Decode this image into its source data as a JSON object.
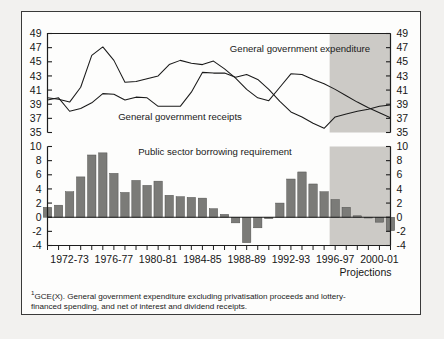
{
  "figure": {
    "footnote_marker": "1",
    "footnote": "GCE(X). General government expenditure excluding privatisation proceeds and lottery-financed spending, and net of interest and dividend receipts.",
    "projections_label": "Projections",
    "shade_color": "#cccac6",
    "line_color": "#1a1a1a",
    "bar_color": "#7b7b78",
    "axis_color": "#1d1d1d"
  },
  "chart_data": [
    {
      "type": "line",
      "panel": "top",
      "title": "",
      "xlabel": "",
      "ylabel": "",
      "ylim": [
        35,
        49
      ],
      "yticks": [
        35,
        37,
        39,
        41,
        43,
        45,
        47,
        49
      ],
      "ytick_labels": [
        "35",
        "37",
        "39",
        "41",
        "43",
        "45",
        "47",
        "49"
      ],
      "grid": false,
      "legend": "inline-annotation",
      "x": [
        "1970-71",
        "1971-72",
        "1972-73",
        "1973-74",
        "1974-75",
        "1975-76",
        "1976-77",
        "1977-78",
        "1978-79",
        "1979-80",
        "1980-81",
        "1981-82",
        "1982-83",
        "1983-84",
        "1984-85",
        "1985-86",
        "1986-87",
        "1987-88",
        "1988-89",
        "1989-90",
        "1990-91",
        "1991-92",
        "1992-93",
        "1993-94",
        "1994-95",
        "1995-96",
        "1996-97",
        "1997-98",
        "1998-99",
        "1999-00",
        "2000-01",
        "2001-02"
      ],
      "series": [
        {
          "name": "General government expenditure",
          "values": [
            39.9,
            39.7,
            39.3,
            41.4,
            45.9,
            47.1,
            45.2,
            42.1,
            42.2,
            42.6,
            43.0,
            44.6,
            45.2,
            44.8,
            44.6,
            45.1,
            44.0,
            42.7,
            41.1,
            39.9,
            39.5,
            41.4,
            43.3,
            43.2,
            42.5,
            41.9,
            41.1,
            40.2,
            39.3,
            38.5,
            37.8,
            37.1
          ]
        },
        {
          "name": "General government receipts",
          "values": [
            39.6,
            39.9,
            38.0,
            38.4,
            39.2,
            40.5,
            40.4,
            39.6,
            40.0,
            39.9,
            38.7,
            38.7,
            38.7,
            40.7,
            43.5,
            43.4,
            43.4,
            42.8,
            43.2,
            42.5,
            41.1,
            39.4,
            37.9,
            37.2,
            36.3,
            35.6,
            37.2,
            37.6,
            38.0,
            38.3,
            38.7,
            38.9
          ]
        }
      ],
      "annotations": [
        {
          "text": "General government expenditure",
          "x": "1993-94"
        },
        {
          "text": "General government receipts",
          "x": "1981-82"
        }
      ]
    },
    {
      "type": "bar",
      "panel": "bottom",
      "title": "Public sector borrowing requirement",
      "xlabel": "",
      "ylabel": "",
      "ylim": [
        -4,
        10
      ],
      "yticks": [
        -4,
        -2,
        0,
        2,
        4,
        6,
        8,
        10
      ],
      "ytick_labels": [
        "-4",
        "-2",
        "0",
        "2",
        "4",
        "6",
        "8",
        "10"
      ],
      "grid": false,
      "categories": [
        "1970-71",
        "1971-72",
        "1972-73",
        "1973-74",
        "1974-75",
        "1975-76",
        "1976-77",
        "1977-78",
        "1978-79",
        "1979-80",
        "1980-81",
        "1981-82",
        "1982-83",
        "1983-84",
        "1984-85",
        "1985-86",
        "1986-87",
        "1987-88",
        "1988-89",
        "1989-90",
        "1990-91",
        "1991-92",
        "1992-93",
        "1993-94",
        "1994-95",
        "1995-96",
        "1996-97",
        "1997-98",
        "1998-99",
        "1999-00",
        "2000-01",
        "2001-02"
      ],
      "values": [
        1.4,
        1.7,
        3.6,
        5.7,
        8.8,
        9.1,
        6.2,
        3.5,
        5.2,
        4.5,
        5.1,
        3.1,
        2.9,
        2.8,
        2.7,
        1.2,
        0.4,
        -0.8,
        -3.6,
        -1.5,
        -0.2,
        2.0,
        5.4,
        6.4,
        4.7,
        3.6,
        2.5,
        1.4,
        0.2,
        -0.1,
        -0.7,
        -1.9
      ]
    }
  ],
  "xaxis": {
    "tick_labels": [
      {
        "label": "1972-73",
        "at": "1972-73"
      },
      {
        "label": "1976-77",
        "at": "1976-77"
      },
      {
        "label": "1980-81",
        "at": "1980-81"
      },
      {
        "label": "1984-85",
        "at": "1984-85"
      },
      {
        "label": "1988-89",
        "at": "1988-89"
      },
      {
        "label": "1992-93",
        "at": "1992-93"
      },
      {
        "label": "1996-97",
        "at": "1996-97"
      },
      {
        "label": "2000-01",
        "at": "2000-01"
      }
    ],
    "projection_start": "1996-97"
  }
}
